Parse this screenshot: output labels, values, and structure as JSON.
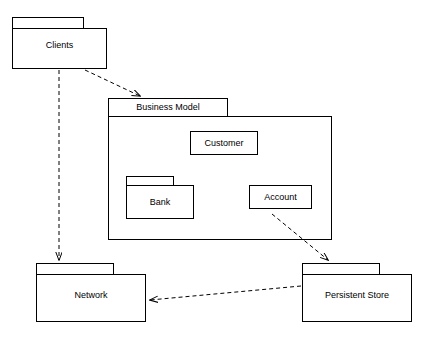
{
  "diagram": {
    "type": "uml-package-diagram",
    "background_color": "#ffffff",
    "line_color": "#000000",
    "packages": [
      {
        "id": "clients",
        "label": "Clients",
        "tab": {
          "x": 12,
          "y": 17,
          "w": 72,
          "h": 11
        },
        "body": {
          "x": 12,
          "y": 28,
          "w": 95,
          "h": 41
        },
        "label_pos": {
          "x": 12,
          "y": 40,
          "w": 95
        }
      },
      {
        "id": "business-model",
        "label": "Business Model",
        "tab": {
          "x": 108,
          "y": 98,
          "w": 120,
          "h": 18
        },
        "body": {
          "x": 108,
          "y": 116,
          "w": 224,
          "h": 124
        },
        "label_pos": {
          "x": 108,
          "y": 102,
          "w": 120
        }
      },
      {
        "id": "network",
        "label": "Network",
        "tab": {
          "x": 36,
          "y": 263,
          "w": 78,
          "h": 11
        },
        "body": {
          "x": 36,
          "y": 274,
          "w": 110,
          "h": 48
        },
        "label_pos": {
          "x": 36,
          "y": 290,
          "w": 110
        }
      },
      {
        "id": "persistent-store",
        "label": "Persistent Store",
        "tab": {
          "x": 302,
          "y": 263,
          "w": 78,
          "h": 11
        },
        "body": {
          "x": 302,
          "y": 274,
          "w": 110,
          "h": 48
        },
        "label_pos": {
          "x": 302,
          "y": 290,
          "w": 110
        }
      }
    ],
    "inner_packages": [
      {
        "id": "bank",
        "label": "Bank",
        "tab": {
          "x": 126,
          "y": 176,
          "w": 48,
          "h": 9
        },
        "body": {
          "x": 126,
          "y": 185,
          "w": 68,
          "h": 34
        },
        "label_pos": {
          "x": 126,
          "y": 197,
          "w": 68
        }
      }
    ],
    "boxes": [
      {
        "id": "customer",
        "label": "Customer",
        "x": 190,
        "y": 131,
        "w": 68,
        "h": 24
      },
      {
        "id": "account",
        "label": "Account",
        "x": 249,
        "y": 185,
        "w": 63,
        "h": 24
      }
    ],
    "dependencies": [
      {
        "id": "clients-to-business-model",
        "from": "Clients",
        "to": "Business Model",
        "style": "dashed-arrow",
        "x1": 84,
        "y1": 69,
        "x2": 142,
        "y2": 97
      },
      {
        "id": "clients-to-network",
        "from": "Clients",
        "to": "Network",
        "style": "dashed-arrow",
        "x1": 59,
        "y1": 69,
        "x2": 59,
        "y2": 261
      },
      {
        "id": "business-model-to-persistent-store",
        "from": "Business Model",
        "to": "Persistent Store",
        "style": "dashed-arrow",
        "x1": 272,
        "y1": 216,
        "x2": 330,
        "y2": 261
      },
      {
        "id": "persistent-store-to-network",
        "from": "Persistent Store",
        "to": "Network",
        "style": "dashed-arrow",
        "x1": 300,
        "y1": 286,
        "x2": 152,
        "y2": 300
      }
    ]
  }
}
